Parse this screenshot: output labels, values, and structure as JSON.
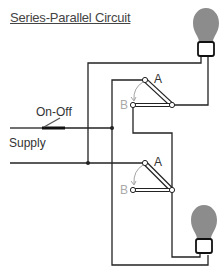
{
  "title": "Series-Parallel Circuit",
  "labels": {
    "on_off": "On-Off",
    "supply": "Supply",
    "switch1_a": "A",
    "switch1_b": "B",
    "switch2_a": "A",
    "switch2_b": "B"
  },
  "colors": {
    "wire": "#222222",
    "bulb": "#8c8c8c",
    "b_label": "#aaaaaa"
  },
  "components": [
    "lamp-top",
    "lamp-bottom",
    "two-way-switch-1",
    "two-way-switch-2",
    "on-off-switch",
    "supply-lines"
  ]
}
